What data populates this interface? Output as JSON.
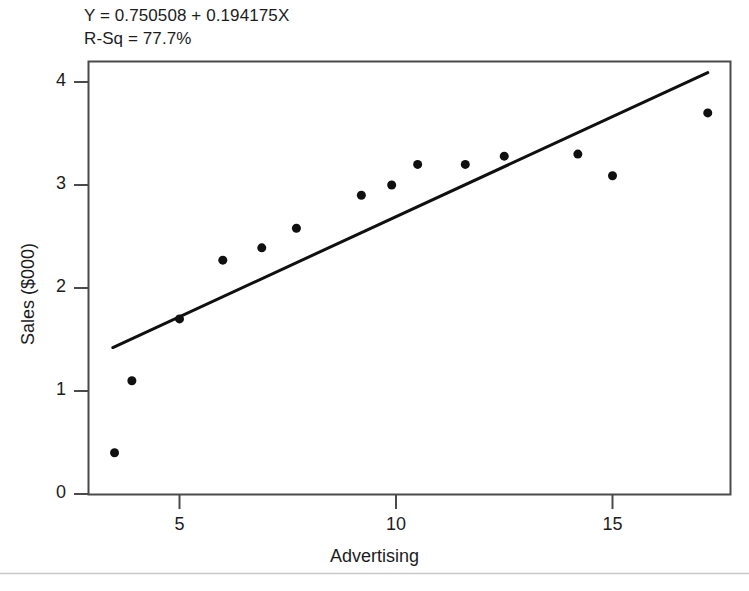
{
  "chart_data": {
    "type": "scatter",
    "title": "",
    "xlabel": "Advertising",
    "ylabel": "Sales ($000)",
    "xlim": [
      3.1,
      17.9
    ],
    "ylim": [
      -0.12,
      4.22
    ],
    "xticks": [
      5,
      10,
      15
    ],
    "yticks": [
      0,
      1,
      2,
      3,
      4
    ],
    "xtick_labels": [
      "5",
      "10",
      "15"
    ],
    "ytick_labels": [
      "0",
      "1",
      "2",
      "3",
      "4"
    ],
    "grid": false,
    "legend": "none",
    "x": [
      3.5,
      3.9,
      5.0,
      6.0,
      6.9,
      7.7,
      9.2,
      9.9,
      10.5,
      11.6,
      12.5,
      14.2,
      15.0,
      17.2
    ],
    "y": [
      0.4,
      1.1,
      1.7,
      2.27,
      2.39,
      2.58,
      2.9,
      3.0,
      3.2,
      3.2,
      3.28,
      3.3,
      3.09,
      3.7
    ],
    "point_color": "#101010",
    "point_size": 9,
    "fit_line": {
      "type": "line",
      "intercept": 0.750508,
      "slope": 0.194175,
      "x_start": 3.46,
      "x_end": 17.2,
      "y_start": 1.422,
      "y_end": 4.091,
      "color": "#101010",
      "width": 3
    },
    "annotations": [
      {
        "name": "regression-equation",
        "text": "Y = 0.750508 + 0.194175X"
      },
      {
        "name": "r-squared",
        "text": "R-Sq = 77.7%"
      }
    ]
  },
  "annotation": {
    "equation": "Y = 0.750508 + 0.194175X",
    "r_squared": "R-Sq = 77.7%"
  },
  "axes": {
    "x_title": "Advertising",
    "y_title": "Sales ($000)",
    "x_tick_labels": [
      "5",
      "10",
      "15"
    ],
    "y_tick_labels": [
      "0",
      "1",
      "2",
      "3",
      "4"
    ]
  },
  "colors": {
    "frame": "#4a4a4a",
    "marker": "#101010",
    "line": "#101010",
    "text": "#1c1c1c",
    "divider": "#c8c8c8",
    "background": "#ffffff"
  }
}
